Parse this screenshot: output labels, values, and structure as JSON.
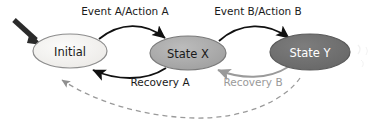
{
  "diagram": {
    "type": "state-machine",
    "title": "",
    "colors": {
      "initial_fill": "#f2f1ef",
      "initial_stroke": "#8d8d8d",
      "state_x_fill": "#a9a9a9",
      "state_x_stroke": "#7a7a7a",
      "state_y_fill": "#6e6e6e",
      "state_y_stroke": "#5a5a5a",
      "label_dark": "#1a1a1a",
      "label_light": "#ffffff",
      "edge_solid": "#111111",
      "edge_gray": "#9a9a9a",
      "edge_dashed": "#9a9a9a",
      "start_arrow": "#2b2b2b"
    },
    "nodes": [
      {
        "id": "initial",
        "label": "Initial",
        "cx": 70,
        "cy": 51,
        "rx": 37,
        "ry": 17,
        "fill_key": "initial_fill",
        "stroke_key": "initial_stroke",
        "text_key": "label_dark"
      },
      {
        "id": "state_x",
        "label": "State X",
        "cx": 188,
        "cy": 53,
        "rx": 38,
        "ry": 17,
        "fill_key": "state_x_fill",
        "stroke_key": "state_x_stroke",
        "text_key": "label_dark"
      },
      {
        "id": "state_y",
        "label": "State Y",
        "cx": 310,
        "cy": 52,
        "rx": 40,
        "ry": 18,
        "fill_key": "state_y_fill",
        "stroke_key": "state_y_stroke",
        "text_key": "label_light"
      }
    ],
    "edges": [
      {
        "id": "start",
        "label": "",
        "style": "solid-thick",
        "from": "",
        "to": "initial"
      },
      {
        "id": "event_a",
        "label": "Event A/Action A",
        "style": "solid",
        "from": "initial",
        "to": "state_x",
        "label_x": 125,
        "label_y": 12
      },
      {
        "id": "event_b",
        "label": "Event B/Action B",
        "style": "solid",
        "from": "state_x",
        "to": "state_y",
        "label_x": 258,
        "label_y": 12
      },
      {
        "id": "recovery_a",
        "label": "Recovery A",
        "style": "solid",
        "from": "state_x",
        "to": "initial",
        "label_x": 160,
        "label_y": 83
      },
      {
        "id": "recovery_b",
        "label": "Recovery B",
        "style": "solid-gray",
        "from": "state_y",
        "to": "state_x",
        "label_x": 253,
        "label_y": 83
      },
      {
        "id": "reset_dashed",
        "label": "",
        "style": "dashed",
        "from": "state_y",
        "to": "initial"
      }
    ]
  }
}
